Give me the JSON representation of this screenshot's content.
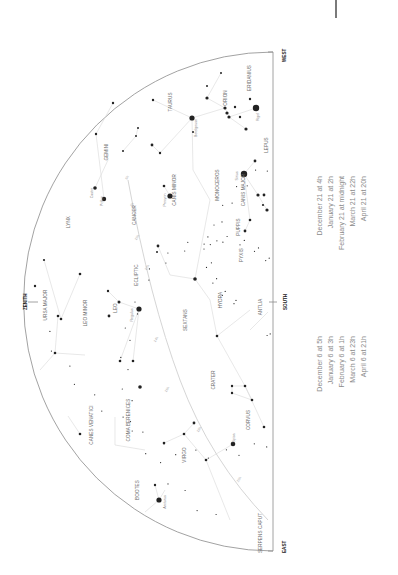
{
  "chart_data": {
    "type": "star-chart",
    "orientation": "rotated 90deg counter-clockwise (horizon on right, zenith on left)",
    "horizon": {
      "x": 273,
      "y_top": 52,
      "y_bottom": 551
    },
    "dome": {
      "cx": 273,
      "cy": 302,
      "r": 240
    },
    "directions": [
      {
        "label": "WEST",
        "x": 283,
        "y": 57
      },
      {
        "label": "SOUTH",
        "x": 285,
        "y": 302
      },
      {
        "label": "EAST",
        "x": 283,
        "y": 547
      },
      {
        "label": "ZENITH",
        "x": 27,
        "y": 303
      }
    ],
    "constellations": [
      {
        "name": "ERIDANIUS",
        "x": 251,
        "y": 78
      },
      {
        "name": "ORION",
        "x": 227,
        "y": 98
      },
      {
        "name": "TAURUS",
        "x": 172,
        "y": 102
      },
      {
        "name": "GEMINI",
        "x": 108,
        "y": 152
      },
      {
        "name": "LEPUS",
        "x": 268,
        "y": 145
      },
      {
        "name": "CANIS MINOR",
        "x": 176,
        "y": 190
      },
      {
        "name": "MONOCEROS",
        "x": 219,
        "y": 185
      },
      {
        "name": "CANIS MAJOR",
        "x": 245,
        "y": 190
      },
      {
        "name": "CANCER",
        "x": 136,
        "y": 215
      },
      {
        "name": "LYNX",
        "x": 70,
        "y": 222
      },
      {
        "name": "PUPPIS",
        "x": 240,
        "y": 227
      },
      {
        "name": "PYXIS",
        "x": 243,
        "y": 255
      },
      {
        "name": "ECLIPTIC",
        "x": 138,
        "y": 275
      },
      {
        "name": "URSA MAJOR",
        "x": 47,
        "y": 305
      },
      {
        "name": "LEO MINOR",
        "x": 87,
        "y": 313
      },
      {
        "name": "LEO",
        "x": 117,
        "y": 308
      },
      {
        "name": "HYDRA",
        "x": 222,
        "y": 300
      },
      {
        "name": "ANTLIA",
        "x": 262,
        "y": 307
      },
      {
        "name": "SEXTANS",
        "x": 187,
        "y": 320
      },
      {
        "name": "CRATER",
        "x": 215,
        "y": 380
      },
      {
        "name": "COMA BERENICES",
        "x": 130,
        "y": 420
      },
      {
        "name": "CANES VENATICI",
        "x": 93,
        "y": 425
      },
      {
        "name": "CORVUS",
        "x": 250,
        "y": 420
      },
      {
        "name": "VIRGO",
        "x": 186,
        "y": 455
      },
      {
        "name": "BOOTES",
        "x": 139,
        "y": 490
      },
      {
        "name": "SERPENS CAPUT",
        "x": 262,
        "y": 533
      }
    ],
    "named_stars": [
      {
        "name": "Rigel",
        "x": 259,
        "y": 117
      },
      {
        "name": "Betelgeuse",
        "x": 197,
        "y": 128
      },
      {
        "name": "Sirius",
        "x": 238,
        "y": 176
      },
      {
        "name": "Procyon",
        "x": 166,
        "y": 200
      },
      {
        "name": "Castor",
        "x": 93,
        "y": 193
      },
      {
        "name": "Pollux",
        "x": 103,
        "y": 201
      },
      {
        "name": "Regulus",
        "x": 133,
        "y": 315
      },
      {
        "name": "Spica",
        "x": 235,
        "y": 438
      },
      {
        "name": "Arcturus",
        "x": 166,
        "y": 502
      }
    ],
    "ecliptic_hours": [
      "6h",
      "8h",
      "10h",
      "12h",
      "14h",
      "16h",
      "18h",
      "20h"
    ],
    "stars": [
      {
        "x": 256,
        "y": 108,
        "r": 3.2
      },
      {
        "x": 192,
        "y": 118,
        "r": 2.6
      },
      {
        "x": 244,
        "y": 174,
        "r": 3.2
      },
      {
        "x": 170,
        "y": 196,
        "r": 2.6
      },
      {
        "x": 95,
        "y": 188,
        "r": 1.8
      },
      {
        "x": 104,
        "y": 199,
        "r": 2.2
      },
      {
        "x": 139,
        "y": 309,
        "r": 2.6
      },
      {
        "x": 233,
        "y": 444,
        "r": 2.3
      },
      {
        "x": 159,
        "y": 500,
        "r": 2.6
      },
      {
        "x": 207,
        "y": 98,
        "r": 1.6
      },
      {
        "x": 225,
        "y": 108,
        "r": 1.6
      },
      {
        "x": 227,
        "y": 113,
        "r": 1.6
      },
      {
        "x": 229,
        "y": 117,
        "r": 1.6
      },
      {
        "x": 235,
        "y": 107,
        "r": 1.2
      },
      {
        "x": 240,
        "y": 117,
        "r": 1.2
      },
      {
        "x": 246,
        "y": 129,
        "r": 1.6
      },
      {
        "x": 250,
        "y": 99,
        "r": 1.2
      },
      {
        "x": 221,
        "y": 73,
        "r": 1.0
      },
      {
        "x": 153,
        "y": 100,
        "r": 1.2
      },
      {
        "x": 152,
        "y": 145,
        "r": 1.4
      },
      {
        "x": 160,
        "y": 153,
        "r": 1.2
      },
      {
        "x": 136,
        "y": 136,
        "r": 1.0
      },
      {
        "x": 138,
        "y": 128,
        "r": 1.0
      },
      {
        "x": 123,
        "y": 151,
        "r": 1.0
      },
      {
        "x": 255,
        "y": 161,
        "r": 1.4
      },
      {
        "x": 258,
        "y": 195,
        "r": 1.6
      },
      {
        "x": 264,
        "y": 195,
        "r": 1.4
      },
      {
        "x": 267,
        "y": 210,
        "r": 1.6
      },
      {
        "x": 263,
        "y": 205,
        "r": 1.1
      },
      {
        "x": 250,
        "y": 220,
        "r": 1.3
      },
      {
        "x": 245,
        "y": 231,
        "r": 1.4
      },
      {
        "x": 164,
        "y": 186,
        "r": 1.3
      },
      {
        "x": 158,
        "y": 246,
        "r": 1.4
      },
      {
        "x": 157,
        "y": 252,
        "r": 1.0
      },
      {
        "x": 195,
        "y": 279,
        "r": 1.8
      },
      {
        "x": 108,
        "y": 291,
        "r": 1.2
      },
      {
        "x": 119,
        "y": 302,
        "r": 1.5
      },
      {
        "x": 109,
        "y": 316,
        "r": 1.4
      },
      {
        "x": 58,
        "y": 316,
        "r": 1.3
      },
      {
        "x": 61,
        "y": 319,
        "r": 1.3
      },
      {
        "x": 44,
        "y": 260,
        "r": 1.1
      },
      {
        "x": 80,
        "y": 274,
        "r": 1.3
      },
      {
        "x": 35,
        "y": 286,
        "r": 1.2
      },
      {
        "x": 55,
        "y": 353,
        "r": 1.3
      },
      {
        "x": 120,
        "y": 361,
        "r": 1.3
      },
      {
        "x": 133,
        "y": 361,
        "r": 1.3
      },
      {
        "x": 140,
        "y": 387,
        "r": 1.8
      },
      {
        "x": 217,
        "y": 336,
        "r": 1.3
      },
      {
        "x": 245,
        "y": 386,
        "r": 1.3
      },
      {
        "x": 232,
        "y": 386,
        "r": 1.2
      },
      {
        "x": 232,
        "y": 393,
        "r": 1.2
      },
      {
        "x": 252,
        "y": 400,
        "r": 1.3
      },
      {
        "x": 264,
        "y": 427,
        "r": 1.3
      },
      {
        "x": 194,
        "y": 423,
        "r": 1.4
      },
      {
        "x": 184,
        "y": 434,
        "r": 1.3
      },
      {
        "x": 164,
        "y": 443,
        "r": 1.3
      },
      {
        "x": 206,
        "y": 460,
        "r": 1.3
      },
      {
        "x": 155,
        "y": 485,
        "r": 1.2
      },
      {
        "x": 80,
        "y": 434,
        "r": 1.3
      },
      {
        "x": 96,
        "y": 134,
        "r": 1.2
      },
      {
        "x": 113,
        "y": 103,
        "r": 1.2
      },
      {
        "x": 207,
        "y": 86,
        "r": 1.0
      },
      {
        "x": 193,
        "y": 132,
        "r": 1.0
      }
    ]
  },
  "time_table": {
    "left_column": [
      "December 6 at   5h",
      "January 6 at   3h",
      "February 6 at   1h",
      "March 6 at 23h",
      "April 6 at 21h"
    ],
    "right_column": [
      "December 21 at        4h",
      "January 21 at        2h",
      "February 21 at midnight",
      "March 21 at      22h",
      "April 21 at      20h"
    ]
  },
  "colors": {
    "star": "#222222",
    "lines": "#d8d8d8",
    "text": "#6b6b6b",
    "horizon": "#8a8a8a"
  }
}
